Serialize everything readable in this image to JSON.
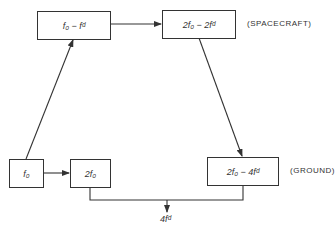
{
  "diagram": {
    "boxes": {
      "f0_minus_fd": "f₀ − fᵈ",
      "two_f0_minus_two_fd": "2f₀ − 2fᵈ",
      "f0": "f₀",
      "two_f0": "2f₀",
      "two_f0_minus_four_fd": "2f₀ − 4fᵈ"
    },
    "labels": {
      "spacecraft": "(SPACECRAFT)",
      "ground": "(GROUND)"
    },
    "output": "4fᵈ",
    "colors": {
      "line": "#333333",
      "background": "#ffffff"
    }
  }
}
